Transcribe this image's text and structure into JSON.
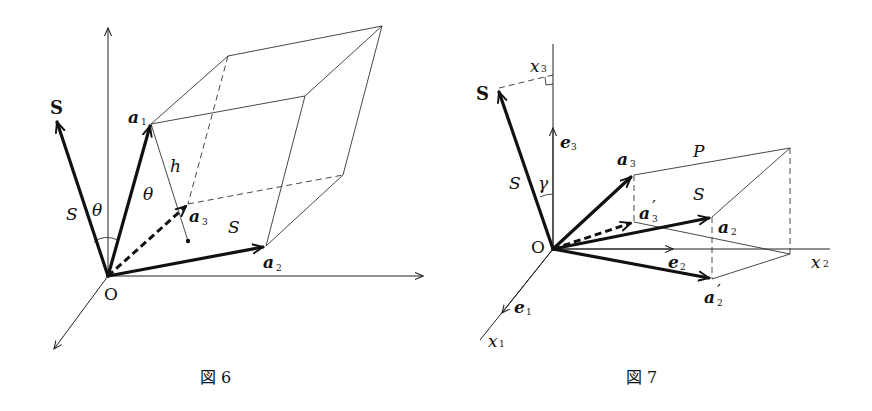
{
  "figures": [
    {
      "id": "fig6",
      "caption": "図 6",
      "labels": {
        "normal_vector": "S",
        "normal_magnitude": "S",
        "angle_at_origin": "θ",
        "angle_inner": "θ",
        "height": "h",
        "vec_a1": "a",
        "vec_a1_sub": "1",
        "vec_a2": "a",
        "vec_a2_sub": "2",
        "vec_a3": "a",
        "vec_a3_sub": "3",
        "area": "S",
        "origin": "O"
      }
    },
    {
      "id": "fig7",
      "caption": "図 7",
      "labels": {
        "normal_vector": "S",
        "normal_magnitude": "S",
        "angle": "γ",
        "axis_x1": "x",
        "axis_x1_sub": "1",
        "axis_x2": "x",
        "axis_x2_sub": "2",
        "axis_x3": "x",
        "axis_x3_sub": "3",
        "basis_e1": "e",
        "basis_e1_sub": "1",
        "basis_e2": "e",
        "basis_e2_sub": "2",
        "basis_e3": "e",
        "basis_e3_sub": "3",
        "vec_a2": "a",
        "vec_a2_sub": "2",
        "vec_a3": "a",
        "vec_a3_sub": "3",
        "vec_a2p": "a",
        "vec_a2p_sub": "2",
        "vec_a2p_prime": "′",
        "vec_a3p": "a",
        "vec_a3p_sub": "3",
        "vec_a3p_prime": "′",
        "plane": "P",
        "area": "S",
        "origin": "O"
      }
    }
  ]
}
